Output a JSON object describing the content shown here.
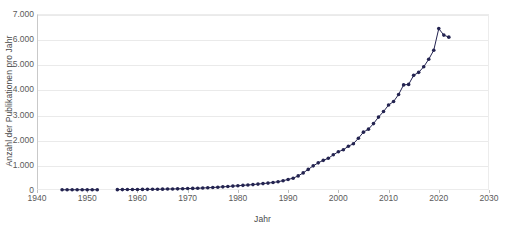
{
  "chart_data": {
    "type": "line",
    "title": "",
    "subtitle": "",
    "xlabel": "Jahr",
    "ylabel": "Anzahl der Publikationen pro Jahr",
    "xlim": [
      1940,
      2030
    ],
    "ylim": [
      0,
      7000
    ],
    "xticks": [
      1940,
      1950,
      1960,
      1970,
      1980,
      1990,
      2000,
      2010,
      2020,
      2030
    ],
    "xtick_labels": [
      "1940",
      "1950",
      "1960",
      "1970",
      "1980",
      "1990",
      "2000",
      "2010",
      "2020",
      "2030"
    ],
    "yticks": [
      0,
      1000,
      2000,
      3000,
      4000,
      5000,
      6000,
      7000
    ],
    "ytick_labels": [
      "0",
      "1.000",
      "2.000",
      "3.000",
      "4.000",
      "5.000",
      "6.000",
      "7.000"
    ],
    "grid": "horizontal",
    "legend": "none",
    "series": [
      {
        "name": "Publikationen pro Jahr",
        "color": "#232350",
        "marker": "circle",
        "x": [
          1945,
          1946,
          1947,
          1948,
          1949,
          1950,
          1951,
          1952,
          1956,
          1957,
          1958,
          1959,
          1960,
          1961,
          1962,
          1963,
          1964,
          1965,
          1966,
          1967,
          1968,
          1969,
          1970,
          1971,
          1972,
          1973,
          1974,
          1975,
          1976,
          1977,
          1978,
          1979,
          1980,
          1981,
          1982,
          1983,
          1984,
          1985,
          1986,
          1987,
          1988,
          1989,
          1990,
          1991,
          1992,
          1993,
          1994,
          1995,
          1996,
          1997,
          1998,
          1999,
          2000,
          2001,
          2002,
          2003,
          2004,
          2005,
          2006,
          2007,
          2008,
          2009,
          2010,
          2011,
          2012,
          2013,
          2014,
          2015,
          2016,
          2017,
          2018,
          2019,
          2020,
          2021,
          2022
        ],
        "values": [
          8,
          10,
          9,
          11,
          10,
          12,
          11,
          10,
          14,
          16,
          18,
          20,
          22,
          24,
          26,
          28,
          30,
          34,
          38,
          42,
          46,
          52,
          58,
          64,
          72,
          80,
          90,
          100,
          112,
          126,
          140,
          155,
          170,
          185,
          200,
          215,
          235,
          255,
          275,
          300,
          330,
          370,
          420,
          470,
          560,
          680,
          820,
          960,
          1080,
          1180,
          1260,
          1400,
          1520,
          1600,
          1740,
          1840,
          2060,
          2300,
          2420,
          2640,
          2900,
          3120,
          3380,
          3520,
          3800,
          4180,
          4200,
          4560,
          4680,
          4900,
          5200,
          5560,
          6420,
          6160,
          6080
        ]
      }
    ]
  }
}
